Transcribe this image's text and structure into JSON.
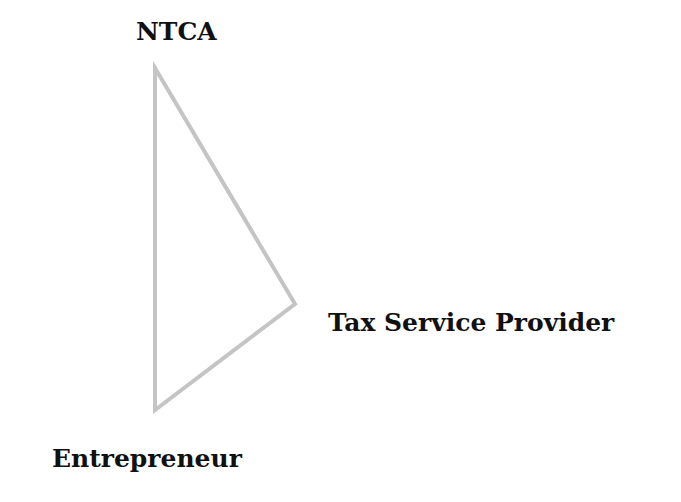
{
  "diagram": {
    "type": "triangle",
    "nodes": [
      {
        "id": "top",
        "label": "NTCA",
        "x": 155,
        "y": 68
      },
      {
        "id": "right",
        "label": "Tax Service Provider",
        "x": 295,
        "y": 304
      },
      {
        "id": "bottom",
        "label": "Entrepreneur",
        "x": 155,
        "y": 410
      }
    ],
    "edges": [
      {
        "from": "top",
        "to": "right"
      },
      {
        "from": "right",
        "to": "bottom"
      },
      {
        "from": "bottom",
        "to": "top"
      }
    ],
    "line_color": "#c4c4c4"
  }
}
